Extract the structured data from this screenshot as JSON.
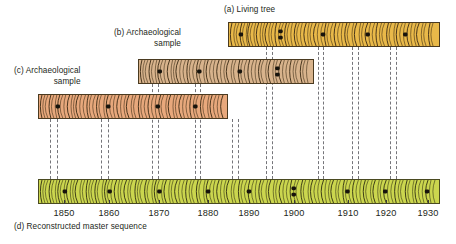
{
  "figure": {
    "background": "#ffffff",
    "text_color": "#231f20"
  },
  "captions": {
    "a": "(a) Living tree",
    "b_line1": "(b) Archaeological",
    "b_line2": "sample",
    "c_line1": "(c) Archaeological",
    "c_line2": "sample",
    "d": "(d) Reconstructed master sequence"
  },
  "axis": {
    "label_color": "#231f20",
    "tick_color": "#3a3a3a",
    "year_min": 1845,
    "year_max": 1938,
    "ticks": [
      {
        "label": "1850",
        "x": 64
      },
      {
        "label": "1860",
        "x": 109
      },
      {
        "label": "1870",
        "x": 159
      },
      {
        "label": "1880",
        "x": 208
      },
      {
        "label": "1890",
        "x": 249
      },
      {
        "label": "1900",
        "x": 294
      },
      {
        "label": "1910",
        "x": 348
      },
      {
        "label": "1920",
        "x": 386
      },
      {
        "label": "1930",
        "x": 428
      }
    ]
  },
  "samples": [
    {
      "id": "a",
      "name": "living-tree",
      "label": "(a) Living tree",
      "color": "#E9B949",
      "edge": "#4a3a20",
      "ring_color": "#3a2a14",
      "x": 228,
      "y": 22,
      "width": 212,
      "height": 25,
      "rings": [
        3,
        7,
        10,
        13,
        16,
        19,
        21,
        24,
        27,
        30,
        33,
        36,
        39,
        42,
        45,
        48,
        52,
        55,
        58,
        61,
        64,
        68,
        71,
        74,
        78,
        81,
        84,
        88,
        91,
        95,
        98,
        101,
        105,
        108,
        112,
        115,
        119,
        122,
        126,
        129,
        133,
        136,
        140,
        143,
        147,
        150,
        154,
        157,
        161,
        164,
        168,
        171,
        175,
        178,
        182,
        185,
        189,
        192,
        196,
        199,
        203,
        206
      ],
      "markers": [
        {
          "x": 12,
          "double": false
        },
        {
          "x": 52,
          "double": true
        },
        {
          "x": 95,
          "double": false
        },
        {
          "x": 140,
          "double": false
        },
        {
          "x": 178,
          "double": false
        }
      ]
    },
    {
      "id": "b",
      "name": "archaeological-sample-b",
      "label": "(b) Archaeological sample",
      "color": "#D8B38C",
      "edge": "#4a3a20",
      "ring_color": "#3a2a14",
      "x": 138,
      "y": 59,
      "width": 176,
      "height": 25,
      "rings": [
        3,
        6,
        9,
        12,
        15,
        18,
        21,
        24,
        27,
        31,
        34,
        37,
        40,
        43,
        47,
        50,
        53,
        57,
        60,
        63,
        67,
        70,
        74,
        77,
        81,
        84,
        88,
        91,
        95,
        98,
        102,
        105,
        109,
        112,
        116,
        119,
        123,
        126,
        130,
        133,
        137,
        140,
        144,
        147,
        151,
        154,
        158,
        161,
        165,
        168,
        171
      ],
      "markers": [
        {
          "x": 21,
          "double": false
        },
        {
          "x": 61,
          "double": false
        },
        {
          "x": 102,
          "double": false
        },
        {
          "x": 140,
          "double": true
        }
      ]
    },
    {
      "id": "c",
      "name": "archaeological-sample-c",
      "label": "(c) Archaeological sample",
      "color": "#E8A87C",
      "edge": "#4a3a20",
      "ring_color": "#3a2a14",
      "x": 38,
      "y": 94,
      "width": 190,
      "height": 25,
      "rings": [
        3,
        6,
        9,
        12,
        15,
        18,
        21,
        24,
        27,
        31,
        34,
        37,
        40,
        43,
        47,
        50,
        53,
        57,
        60,
        63,
        67,
        70,
        74,
        77,
        81,
        84,
        88,
        91,
        95,
        98,
        102,
        105,
        109,
        112,
        116,
        119,
        123,
        126,
        130,
        133,
        137,
        140,
        144,
        147,
        151,
        154,
        158,
        161,
        165,
        168,
        172,
        175,
        179,
        182,
        186
      ],
      "markers": [
        {
          "x": 19,
          "double": false
        },
        {
          "x": 70,
          "double": false
        },
        {
          "x": 120,
          "double": false
        },
        {
          "x": 158,
          "double": false
        }
      ]
    },
    {
      "id": "d",
      "name": "reconstructed-master-sequence",
      "label": "(d) Reconstructed master sequence",
      "color": "#CBD64E",
      "edge": "#4a4a20",
      "ring_color": "#2f2f12",
      "x": 38,
      "y": 179,
      "width": 402,
      "height": 25,
      "rings": [
        3,
        6,
        9,
        12,
        15,
        18,
        21,
        24,
        27,
        30,
        33,
        36,
        39,
        43,
        46,
        49,
        52,
        55,
        58,
        61,
        65,
        68,
        71,
        74,
        78,
        81,
        84,
        88,
        91,
        94,
        98,
        101,
        104,
        108,
        111,
        115,
        118,
        121,
        125,
        128,
        132,
        135,
        139,
        142,
        146,
        149,
        153,
        156,
        160,
        163,
        167,
        170,
        174,
        177,
        181,
        184,
        188,
        191,
        195,
        198,
        202,
        205,
        209,
        212,
        216,
        219,
        223,
        226,
        230,
        233,
        237,
        240,
        244,
        247,
        251,
        254,
        258,
        261,
        265,
        268,
        272,
        275,
        279,
        282,
        286,
        289,
        293,
        296,
        300,
        303,
        307,
        310,
        314,
        317,
        321,
        324,
        328,
        331,
        335,
        338,
        342,
        345,
        349,
        352,
        356,
        359,
        363,
        366,
        370,
        373,
        377,
        380,
        384,
        387,
        391,
        394,
        398
      ],
      "markers": [
        {
          "x": 26,
          "double": false
        },
        {
          "x": 71,
          "double": false
        },
        {
          "x": 121,
          "double": false
        },
        {
          "x": 170,
          "double": false
        },
        {
          "x": 211,
          "double": false
        },
        {
          "x": 256,
          "double": true
        },
        {
          "x": 310,
          "double": false
        },
        {
          "x": 348,
          "double": false
        },
        {
          "x": 390,
          "double": false
        }
      ]
    }
  ],
  "tie_lines": [
    {
      "name": "tie-1850-left",
      "x": 50,
      "top": 119,
      "bottom": 179
    },
    {
      "name": "tie-1850-right",
      "x": 57,
      "top": 119,
      "bottom": 179
    },
    {
      "name": "tie-1860-left",
      "x": 101,
      "top": 119,
      "bottom": 179
    },
    {
      "name": "tie-1860-right",
      "x": 108,
      "top": 119,
      "bottom": 179
    },
    {
      "name": "tie-1870-left",
      "x": 152,
      "top": 84,
      "bottom": 179
    },
    {
      "name": "tie-1870-right",
      "x": 158,
      "top": 84,
      "bottom": 179
    },
    {
      "name": "tie-1878-left",
      "x": 195,
      "top": 84,
      "bottom": 179
    },
    {
      "name": "tie-1878-right",
      "x": 200,
      "top": 84,
      "bottom": 179
    },
    {
      "name": "tie-1882-left",
      "x": 232,
      "top": 119,
      "bottom": 179
    },
    {
      "name": "tie-1882-right",
      "x": 238,
      "top": 119,
      "bottom": 179
    },
    {
      "name": "tie-1890-left",
      "x": 266,
      "top": 47,
      "bottom": 179
    },
    {
      "name": "tie-1890-right",
      "x": 272,
      "top": 47,
      "bottom": 179
    },
    {
      "name": "tie-1900-left",
      "x": 318,
      "top": 47,
      "bottom": 179
    },
    {
      "name": "tie-1900-right",
      "x": 323,
      "top": 47,
      "bottom": 179
    },
    {
      "name": "tie-1910-left",
      "x": 352,
      "top": 47,
      "bottom": 179
    },
    {
      "name": "tie-1910-right",
      "x": 358,
      "top": 47,
      "bottom": 179
    },
    {
      "name": "tie-1922-left",
      "x": 390,
      "top": 47,
      "bottom": 179
    },
    {
      "name": "tie-1922-right",
      "x": 396,
      "top": 47,
      "bottom": 179
    }
  ]
}
